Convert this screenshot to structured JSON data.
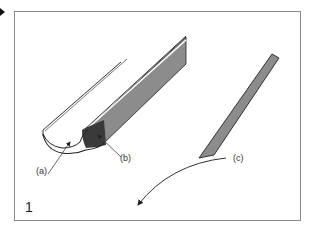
{
  "figure": {
    "number": "1",
    "labels": {
      "a": "(a)",
      "b": "(b)",
      "c": "(c)"
    },
    "colors": {
      "frame": "#8a8a8a",
      "bevel_dark": "#3a3a3a",
      "shaft_gray": "#8c8c8c",
      "outline": "#222222"
    }
  }
}
